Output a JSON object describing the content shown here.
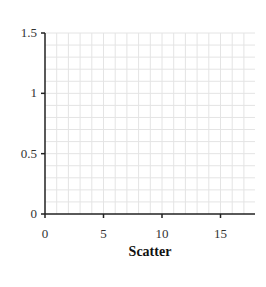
{
  "chart_data": {
    "type": "scatter",
    "title": "Scatter",
    "xlabel": "",
    "ylabel": "",
    "xlim": [
      0,
      18
    ],
    "ylim": [
      0,
      1.5
    ],
    "x_ticks": [
      0,
      5,
      10,
      15
    ],
    "x_tick_labels": [
      "0",
      "5",
      "10",
      "15"
    ],
    "y_ticks": [
      0,
      0.5,
      1,
      1.5
    ],
    "y_tick_labels": [
      "0",
      "0.5",
      "1",
      "1.5"
    ],
    "grid": true,
    "minor_grid_x_step": 1,
    "minor_grid_y_step": 0.1,
    "series": [],
    "legend": null
  },
  "colors": {
    "axis": "#222222",
    "grid": "#e4e4e4"
  }
}
